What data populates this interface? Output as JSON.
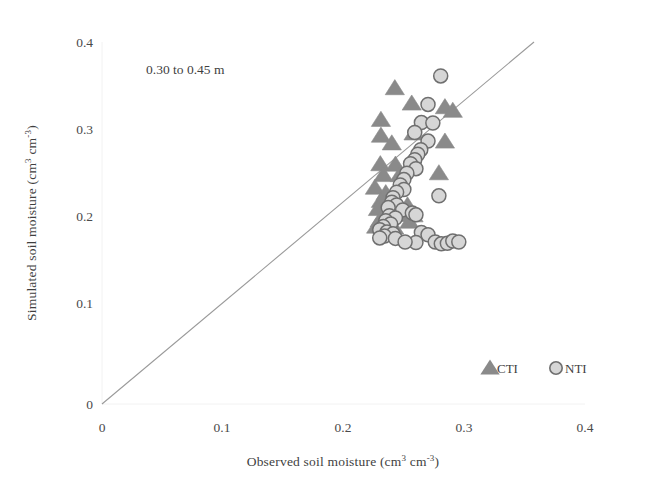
{
  "figure": {
    "background": "#ffffff",
    "width": 668,
    "height": 498
  },
  "annotation": {
    "text": "0.30 to 0.45 m"
  },
  "legend": {
    "position": "bottom-right",
    "entries": [
      {
        "label": "CTI",
        "marker": "triangle",
        "fill": "#8a8a8a",
        "stroke": "#8a8a8a"
      },
      {
        "label": "NTI",
        "marker": "circle",
        "fill": "#d6d6d6",
        "stroke": "#7a7a7a"
      }
    ]
  },
  "axes": {
    "x": {
      "label_prefix": "Observed soil moisture (cm",
      "label_sup1": "3",
      "label_mid": " cm",
      "label_sup2": "-3",
      "label_suffix": ")",
      "label_full": "Observed soil moisture (cm3 cm-3)",
      "ticks": [
        "0",
        "0.1",
        "0.2",
        "0.3",
        "0.4"
      ],
      "min": 0,
      "max": 0.4
    },
    "y": {
      "label_prefix": "Simulated soil moisture (cm",
      "label_sup1": "3",
      "label_mid": " cm",
      "label_sup2": "-3",
      "label_suffix": ")",
      "label_full": "Simulated soil moisture (cm3 cm-3)",
      "ticks": [
        "0",
        "0.1",
        "0.2",
        "0.3",
        "0.4"
      ],
      "min": 0,
      "max": 0.4
    }
  },
  "chart_data": {
    "type": "scatter",
    "title": "",
    "subtitle": "0.30 to 0.45 m",
    "xlabel": "Observed soil moisture (cm3 cm-3)",
    "ylabel": "Simulated soil moisture (cm3 cm-3)",
    "xlim": [
      0,
      0.4
    ],
    "ylim": [
      0,
      0.4
    ],
    "xticks": [
      0,
      0.1,
      0.2,
      0.3,
      0.4
    ],
    "yticks": [
      0,
      0.1,
      0.2,
      0.3,
      0.4
    ],
    "grid": false,
    "legend_position": "bottom-right",
    "reference_line": {
      "name": "1:1 line",
      "x": [
        0.0,
        0.358
      ],
      "y": [
        0.0,
        0.393
      ],
      "color": "#9a9a9a"
    },
    "series": [
      {
        "name": "CTI",
        "marker": "triangle",
        "color": "#8a8a8a",
        "points": [
          [
            0.2425,
            0.349
          ],
          [
            0.2565,
            0.332
          ],
          [
            0.231,
            0.314
          ],
          [
            0.284,
            0.328
          ],
          [
            0.2905,
            0.324
          ],
          [
            0.231,
            0.2965
          ],
          [
            0.258,
            0.299
          ],
          [
            0.24,
            0.288
          ],
          [
            0.284,
            0.29
          ],
          [
            0.2305,
            0.265
          ],
          [
            0.243,
            0.2645
          ],
          [
            0.233,
            0.253
          ],
          [
            0.2465,
            0.253
          ],
          [
            0.279,
            0.255
          ],
          [
            0.226,
            0.239
          ],
          [
            0.235,
            0.233
          ],
          [
            0.231,
            0.2245
          ],
          [
            0.2395,
            0.223
          ],
          [
            0.2285,
            0.2155
          ],
          [
            0.253,
            0.2195
          ],
          [
            0.2475,
            0.209
          ],
          [
            0.258,
            0.2085
          ],
          [
            0.23,
            0.203
          ],
          [
            0.2545,
            0.2015
          ],
          [
            0.227,
            0.196
          ],
          [
            0.242,
            0.195
          ]
        ]
      },
      {
        "name": "NTI",
        "marker": "circle",
        "fill": "#d6d6d6",
        "stroke": "#6f6f6f",
        "points": [
          [
            0.2805,
            0.3625
          ],
          [
            0.27,
            0.331
          ],
          [
            0.2645,
            0.311
          ],
          [
            0.274,
            0.3105
          ],
          [
            0.259,
            0.3
          ],
          [
            0.27,
            0.2905
          ],
          [
            0.264,
            0.281
          ],
          [
            0.2615,
            0.276
          ],
          [
            0.259,
            0.27
          ],
          [
            0.2555,
            0.2655
          ],
          [
            0.26,
            0.26
          ],
          [
            0.2525,
            0.255
          ],
          [
            0.25,
            0.248
          ],
          [
            0.247,
            0.242
          ],
          [
            0.25,
            0.237
          ],
          [
            0.244,
            0.234
          ],
          [
            0.241,
            0.228
          ],
          [
            0.279,
            0.23
          ],
          [
            0.24,
            0.223
          ],
          [
            0.244,
            0.22
          ],
          [
            0.237,
            0.217
          ],
          [
            0.249,
            0.2145
          ],
          [
            0.257,
            0.211
          ],
          [
            0.26,
            0.209
          ],
          [
            0.238,
            0.208
          ],
          [
            0.243,
            0.2055
          ],
          [
            0.235,
            0.2025
          ],
          [
            0.239,
            0.199
          ],
          [
            0.233,
            0.196
          ],
          [
            0.23,
            0.1925
          ],
          [
            0.236,
            0.19
          ],
          [
            0.241,
            0.188
          ],
          [
            0.234,
            0.1855
          ],
          [
            0.23,
            0.1835
          ],
          [
            0.243,
            0.183
          ],
          [
            0.2645,
            0.1895
          ],
          [
            0.27,
            0.187
          ],
          [
            0.276,
            0.179
          ],
          [
            0.281,
            0.177
          ],
          [
            0.286,
            0.1775
          ],
          [
            0.2905,
            0.18
          ],
          [
            0.2955,
            0.179
          ],
          [
            0.26,
            0.1785
          ],
          [
            0.251,
            0.179
          ]
        ]
      }
    ]
  },
  "geometry": {
    "plot_left": 102,
    "plot_right": 585,
    "plot_top": 42,
    "plot_bottom": 404
  }
}
